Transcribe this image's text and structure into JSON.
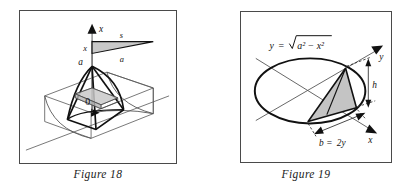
{
  "page": {
    "background_color": "#ffffff",
    "ink_color": "#111111",
    "frame_color": "#4a4a4a",
    "shade_color": "#c9c9c9"
  },
  "figures": [
    {
      "id": "figure-18",
      "caption": "Figure 18",
      "description": "Three-dimensional solid with semicircular cross sections sitting on a base; a vertical x-axis rises from the apex labeled a, with a small cross-section triangle inset.",
      "labels": {
        "axis_x": "x",
        "apex_a": "a",
        "origin_zero": "0",
        "inset_triangle_top": "s",
        "inset_triangle_left": "x",
        "inset_triangle_bottom": "a"
      }
    },
    {
      "id": "figure-19",
      "caption": "Figure 19",
      "description": "Ellipse (circle in perspective) with x and y axes drawn in perspective; a shaded isosceles triangle cross section stands on a chord of length b = 2y with height h.",
      "labels": {
        "equation": "y = √(a² − x²)",
        "equation_lhs": "y",
        "equation_eq": "=",
        "equation_radicand": "a² − x²",
        "axis_y": "y",
        "axis_x": "x",
        "height_h": "h",
        "base_b": "b = 2y",
        "base_b_lhs": "b",
        "base_b_eq": "=",
        "base_b_rhs": "2y"
      }
    }
  ]
}
